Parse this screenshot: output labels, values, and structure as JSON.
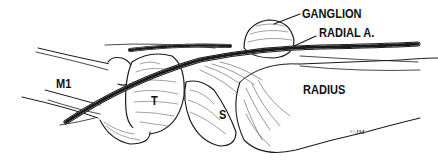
{
  "figure": {
    "type": "anatomical line illustration",
    "labels": {
      "ganglion": "GANGLION",
      "radial_artery": "RADIAL A.",
      "first_metacarpal": "M1",
      "trapezium": "T",
      "scaphoid": "S",
      "radius": "RADIUS"
    },
    "signature": "©JM",
    "colors": {
      "ink": "#111111",
      "background": "#ffffff"
    }
  }
}
